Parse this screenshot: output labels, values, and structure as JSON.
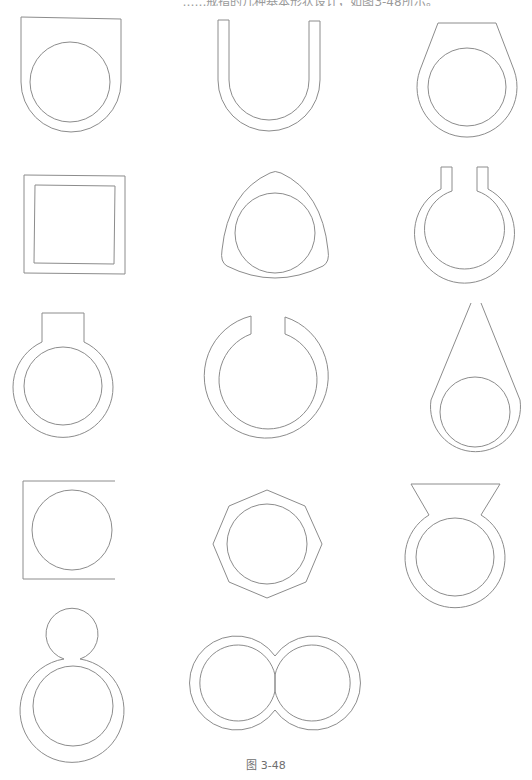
{
  "figure": {
    "top_text": "……戒指的几种基本形状设计，如图3-48所示。",
    "caption": "图 3-48",
    "stroke_color": "#8c8c8c",
    "background": "#ffffff"
  },
  "shapes": [
    {
      "id": 1,
      "name": "flat-top-shield-ring",
      "row": 1,
      "col": 1
    },
    {
      "id": 2,
      "name": "u-shape-band",
      "row": 1,
      "col": 2
    },
    {
      "id": 3,
      "name": "trapezoid-top-ring",
      "row": 1,
      "col": 3
    },
    {
      "id": 4,
      "name": "square-frame",
      "row": 2,
      "col": 1
    },
    {
      "id": 5,
      "name": "rounded-triangle-ring",
      "row": 2,
      "col": 2
    },
    {
      "id": 6,
      "name": "open-ring-with-posts",
      "row": 2,
      "col": 3
    },
    {
      "id": 7,
      "name": "ring-with-square-tab",
      "row": 3,
      "col": 1
    },
    {
      "id": 8,
      "name": "open-gap-ring",
      "row": 3,
      "col": 2
    },
    {
      "id": 9,
      "name": "teardrop-ring",
      "row": 3,
      "col": 3
    },
    {
      "id": 10,
      "name": "open-square-with-circle",
      "row": 4,
      "col": 1
    },
    {
      "id": 11,
      "name": "octagon-ring",
      "row": 4,
      "col": 2
    },
    {
      "id": 12,
      "name": "inverted-trapezoid-ring",
      "row": 4,
      "col": 3
    },
    {
      "id": 13,
      "name": "figure-eight-ring",
      "row": 5,
      "col": 1
    },
    {
      "id": 14,
      "name": "double-ring",
      "row": 5,
      "col": 2
    }
  ]
}
